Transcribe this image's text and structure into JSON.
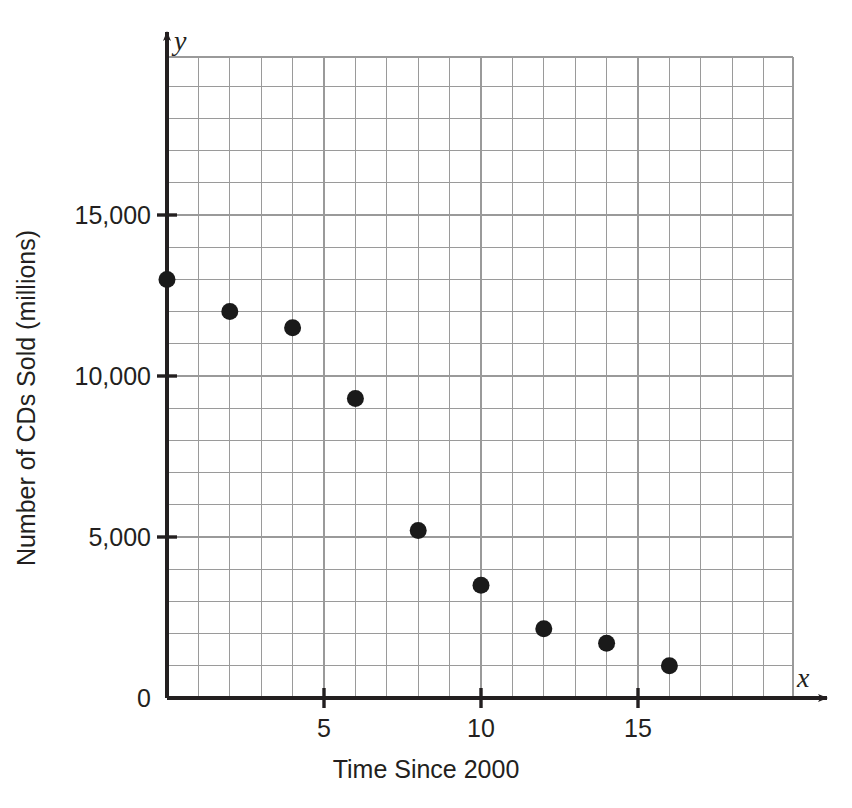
{
  "chart_data": {
    "type": "scatter",
    "title": "",
    "xlabel": "Time Since 2000",
    "ylabel": "Number of CDs Sold (millions)",
    "x_axis_variable": "x",
    "y_axis_variable": "y",
    "xlim": [
      0,
      20
    ],
    "ylim": [
      0,
      20000
    ],
    "grid": true,
    "grid_x_step": 1,
    "grid_y_step": 1000,
    "legend": "none",
    "xticks": [
      {
        "value": 5,
        "label": "5"
      },
      {
        "value": 10,
        "label": "10"
      },
      {
        "value": 15,
        "label": "15"
      }
    ],
    "yticks": [
      {
        "value": 0,
        "label": "0"
      },
      {
        "value": 5000,
        "label": "5,000"
      },
      {
        "value": 10000,
        "label": "10,000"
      },
      {
        "value": 15000,
        "label": "15,000"
      }
    ],
    "point_color": "#1a1a1a",
    "grid_color": "#9a9a9a",
    "axis_color": "#231f20",
    "x": [
      0,
      2,
      4,
      6,
      8,
      10,
      12,
      14,
      16
    ],
    "y": [
      13000,
      12000,
      11500,
      9300,
      5200,
      3500,
      2150,
      1700,
      1000
    ],
    "points": [
      {
        "x": 0,
        "y": 13000
      },
      {
        "x": 2,
        "y": 12000
      },
      {
        "x": 4,
        "y": 11500
      },
      {
        "x": 6,
        "y": 9300
      },
      {
        "x": 8,
        "y": 5200
      },
      {
        "x": 10,
        "y": 3500
      },
      {
        "x": 12,
        "y": 2150
      },
      {
        "x": 14,
        "y": 1700
      },
      {
        "x": 16,
        "y": 1000
      }
    ]
  }
}
